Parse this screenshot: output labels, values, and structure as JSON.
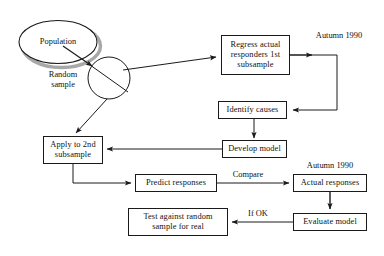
{
  "diagram": {
    "colors": {
      "stroke": "#1a1a1a",
      "shadow": "#a8a8a8",
      "text": "#111111",
      "background": "#ffffff"
    },
    "shapes": {
      "population_ellipse": "Population",
      "random_sample_label": "Random\nsample"
    },
    "boxes": [
      {
        "id": "regress",
        "label": "Regress actual\nresponders 1st\nsubsample"
      },
      {
        "id": "identify",
        "label": "Identify causes"
      },
      {
        "id": "develop",
        "label": "Develop model"
      },
      {
        "id": "apply",
        "label": "Apply to 2nd\nsubsample"
      },
      {
        "id": "predict",
        "label": "Predict responses"
      },
      {
        "id": "actual",
        "label": "Actual responses"
      },
      {
        "id": "evaluate",
        "label": "Evaluate model"
      },
      {
        "id": "test",
        "label": "Test against random\nsample for real"
      }
    ],
    "annotations": [
      {
        "id": "autumn-top",
        "label": "Autumn 1990"
      },
      {
        "id": "autumn-mid",
        "label": "Autumn 1990"
      },
      {
        "id": "compare",
        "label": "Compare"
      },
      {
        "id": "if-ok",
        "label": "If OK"
      }
    ]
  }
}
